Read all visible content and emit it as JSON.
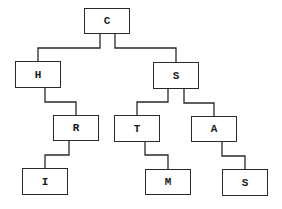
{
  "diagram": {
    "type": "tree",
    "line_color": "#2a2a2a",
    "nodes": [
      {
        "id": "c",
        "label": "C",
        "x": 84,
        "y": 8,
        "w": 46,
        "h": 26
      },
      {
        "id": "h",
        "label": "H",
        "x": 15,
        "y": 61,
        "w": 46,
        "h": 27
      },
      {
        "id": "s1",
        "label": "S",
        "x": 153,
        "y": 62,
        "w": 46,
        "h": 27
      },
      {
        "id": "r",
        "label": "R",
        "x": 53,
        "y": 115,
        "w": 46,
        "h": 26
      },
      {
        "id": "t",
        "label": "T",
        "x": 114,
        "y": 115,
        "w": 46,
        "h": 27
      },
      {
        "id": "a",
        "label": "A",
        "x": 191,
        "y": 116,
        "w": 46,
        "h": 26
      },
      {
        "id": "i",
        "label": "I",
        "x": 22,
        "y": 168,
        "w": 46,
        "h": 27
      },
      {
        "id": "m",
        "label": "M",
        "x": 145,
        "y": 169,
        "w": 46,
        "h": 26
      },
      {
        "id": "s2",
        "label": "S",
        "x": 222,
        "y": 169,
        "w": 46,
        "h": 27
      }
    ],
    "edges": [
      {
        "from": "C",
        "to": "H",
        "points": "100,34 100,48 38,48 38,61"
      },
      {
        "from": "C",
        "to": "S",
        "points": "115,34 115,48 176,48 176,62"
      },
      {
        "from": "H",
        "to": "R",
        "points": "45,88 45,102 76,102 76,115"
      },
      {
        "from": "S",
        "to": "T",
        "points": "168,89 168,102 137,102 137,115"
      },
      {
        "from": "S",
        "to": "A",
        "points": "184,89 184,103 214,103 214,116"
      },
      {
        "from": "R",
        "to": "I",
        "points": "69,141 69,155 45,155 45,168"
      },
      {
        "from": "T",
        "to": "M",
        "points": "145,142 145,155 168,155 168,169"
      },
      {
        "from": "A",
        "to": "S",
        "points": "222,142 222,156 245,156 245,169"
      }
    ]
  }
}
